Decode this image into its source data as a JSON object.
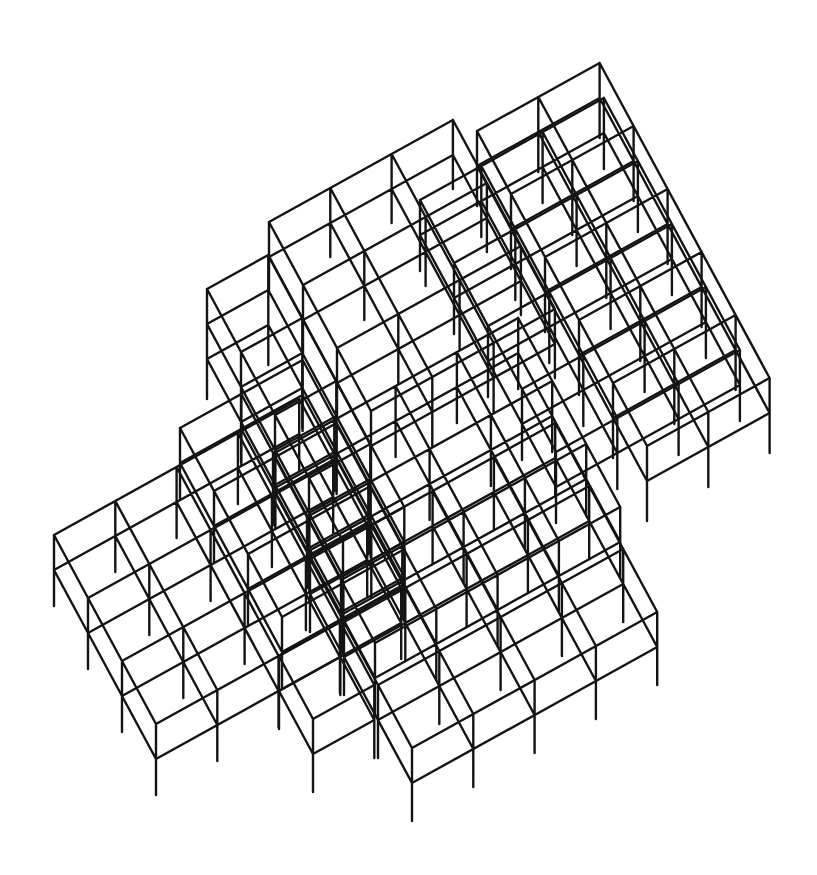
{
  "figure": {
    "type": "isometric-structural-frame",
    "background": "#ffffff",
    "stroke_color": "#141414",
    "stroke_width": 2.4
  },
  "projection": {
    "v_axis": [
      61.3,
      -34
    ],
    "u_axis": [
      34,
      63
    ],
    "level_height": 35
  },
  "blocks": [
    {
      "name": "back-right-tower",
      "origin": [
        477,
        131
      ],
      "ni": 2,
      "nj": 5,
      "levels": 2,
      "stub": 40
    },
    {
      "name": "central-block",
      "origin": [
        420,
        200
      ],
      "ni": 3,
      "nj": 4,
      "levels": 2,
      "stub": 36
    },
    {
      "name": "top-left-plateau",
      "origin": [
        269,
        222
      ],
      "ni": 3,
      "nj": 3,
      "levels": 2,
      "stub": 34
    },
    {
      "name": "left-upper-stack",
      "origin": [
        207,
        289
      ],
      "ni": 1,
      "nj": 4,
      "levels": 3,
      "stub": 40
    },
    {
      "name": "left-mid-block",
      "origin": [
        180,
        428
      ],
      "ni": 2,
      "nj": 3,
      "levels": 2,
      "stub": 36
    },
    {
      "name": "mid-tier-block",
      "origin": [
        273,
        454
      ],
      "ni": 4,
      "nj": 3,
      "levels": 2,
      "stub": 36
    },
    {
      "name": "lower-left-wing",
      "origin": [
        54,
        535
      ],
      "ni": 4,
      "nj": 3,
      "levels": 2,
      "stub": 36
    },
    {
      "name": "lower-wing-step",
      "origin": [
        279,
        656
      ],
      "ni": 1,
      "nj": 1,
      "levels": 2,
      "stub": 38
    },
    {
      "name": "lower-right-wing",
      "origin": [
        310,
        559
      ],
      "ni": 4,
      "nj": 3,
      "levels": 2,
      "stub": 38
    }
  ]
}
